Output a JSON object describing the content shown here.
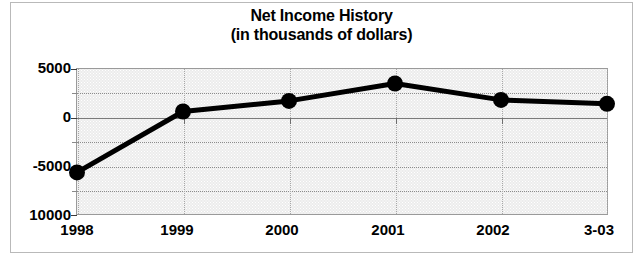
{
  "chart_data": {
    "type": "line",
    "title": "Net Income History",
    "subtitle": "(in thousands of dollars)",
    "title_lines": [
      "Net Income History",
      "(in thousands of dollars)"
    ],
    "xlabel": "",
    "ylabel": "",
    "categories": [
      "1998",
      "1999",
      "2000",
      "2001",
      "2002",
      "3-03"
    ],
    "series": [
      {
        "name": "Net Income",
        "values": [
          -5700,
          600,
          1700,
          3500,
          1800,
          1400
        ],
        "color": "#000000",
        "marker": "circle"
      }
    ],
    "ylim": [
      -10000,
      5000
    ],
    "ytick_labels": [
      "5000",
      "0",
      "-5000",
      "10000"
    ],
    "ytick_values": [
      5000,
      0,
      -5000,
      -10000
    ],
    "yminor_values": [
      2500,
      -2500,
      -7500
    ],
    "grid": true,
    "legend": false,
    "plot_background": "#ececec",
    "gridline_color": "#8c8c8c",
    "zero_line_color": "#7a7a7a"
  }
}
